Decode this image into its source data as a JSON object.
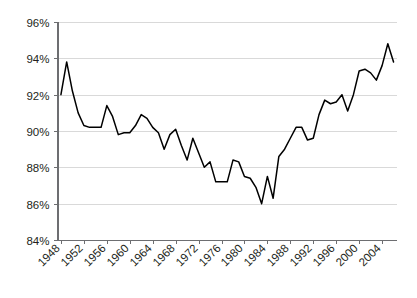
{
  "chart_data": {
    "type": "line",
    "title": "",
    "subtitle": "",
    "xlabel": "",
    "ylabel": "",
    "xlim": [
      1947.4,
      2006.6
    ],
    "ylim": [
      84,
      96
    ],
    "y_tick_labels": [
      "84%",
      "86%",
      "88%",
      "90%",
      "92%",
      "94%",
      "96%"
    ],
    "y_tick_values": [
      84,
      86,
      88,
      90,
      92,
      94,
      96
    ],
    "x_tick_labels": [
      "1948",
      "1952",
      "1956",
      "1960",
      "1964",
      "1968",
      "1972",
      "1976",
      "1980",
      "1984",
      "1988",
      "1992",
      "1996",
      "2000",
      "2004"
    ],
    "x_tick_values": [
      1948,
      1952,
      1956,
      1960,
      1964,
      1968,
      1972,
      1976,
      1980,
      1984,
      1988,
      1992,
      1996,
      2000,
      2004
    ],
    "grid": "horizontal",
    "legend": "none",
    "legend_position": "none",
    "value_suffix": "%",
    "series": [
      {
        "name": "series-1",
        "color": "#000000",
        "x": [
          1948,
          1949,
          1950,
          1951,
          1952,
          1953,
          1954,
          1955,
          1956,
          1957,
          1958,
          1959,
          1960,
          1961,
          1962,
          1963,
          1964,
          1965,
          1966,
          1967,
          1968,
          1969,
          1970,
          1971,
          1972,
          1973,
          1974,
          1975,
          1976,
          1977,
          1978,
          1979,
          1980,
          1981,
          1982,
          1983,
          1984,
          1985,
          1986,
          1987,
          1988,
          1989,
          1990,
          1991,
          1992,
          1993,
          1994,
          1995,
          1996,
          1997,
          1998,
          1999,
          2000,
          2001,
          2002,
          2003,
          2004,
          2005,
          2006
        ],
        "values": [
          92.0,
          93.8,
          92.2,
          91.0,
          90.3,
          90.2,
          90.2,
          90.2,
          91.4,
          90.8,
          89.8,
          89.9,
          89.9,
          90.3,
          90.9,
          90.7,
          90.2,
          89.9,
          89.0,
          89.8,
          90.1,
          89.2,
          88.4,
          89.6,
          88.8,
          88.0,
          88.3,
          87.2,
          87.2,
          87.2,
          88.4,
          88.3,
          87.5,
          87.4,
          86.9,
          86.0,
          87.5,
          86.3,
          88.6,
          89.0,
          89.6,
          90.2,
          90.2,
          89.5,
          89.6,
          90.9,
          91.7,
          91.5,
          91.6,
          92.0,
          91.1,
          92.0,
          93.3,
          93.4,
          93.2,
          92.8,
          93.6,
          94.8,
          93.8
        ]
      }
    ]
  }
}
